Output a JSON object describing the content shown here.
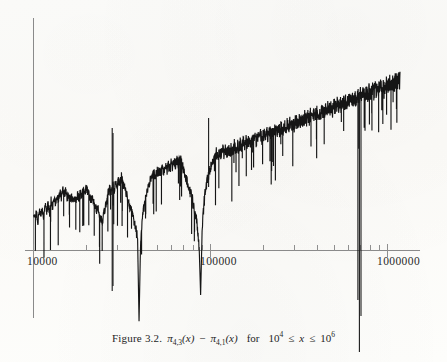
{
  "figure": {
    "label": "Figure 3.2.",
    "expression_plain": "π₄,₃(x) − π₄,₁(x)",
    "pi_symbol": "π",
    "series_a_sub": "4,3",
    "series_b_sub": "4,1",
    "var": "x",
    "minus": "−",
    "for_word": "for",
    "range_plain": "10⁴ ≤ x ≤ 10⁶",
    "range_base": "10",
    "range_exp_low": "4",
    "range_exp_high": "6",
    "le_symbol": "≤",
    "caption_full": "Figure 3.2.  π₄,₃(x) − π₄,₁(x)   for   10⁴ ≤ x ≤ 10⁶"
  },
  "axes": {
    "x_scale": "log",
    "x_min": 10000,
    "x_max": 1000000,
    "x_tick_labels": [
      "10000",
      "100000",
      "1000000"
    ],
    "x_tick_label_positions_px": [
      33,
      210,
      387
    ],
    "y_axis_visible": true,
    "y_tick_labels": [],
    "grid": false,
    "axis_color": "#8a8a8a",
    "curve_color": "#151515",
    "background_color": "#fdfdfb"
  },
  "chart_data": {
    "type": "line",
    "xlabel": "x",
    "ylabel": "π₄,₃(x) − π₄,₁(x)",
    "xscale": "log",
    "xlim": [
      10000,
      1000000
    ],
    "xticks": [
      10000,
      100000,
      1000000
    ],
    "xticklabels": [
      "10000",
      "100000",
      "1000000"
    ],
    "yticks": [],
    "grid": false,
    "legend": null,
    "series": [
      {
        "name": "pi_4,3(x) - pi_4,1(x)",
        "note": "x in log-scale pixel units 0..1 across 10^4..10^6; y in arbitrary plot units where the horizontal axis is 0 and upward is positive.",
        "x_norm": [
          0.0,
          0.004,
          0.008,
          0.012,
          0.016,
          0.02,
          0.024,
          0.028,
          0.032,
          0.036,
          0.04,
          0.044,
          0.048,
          0.052,
          0.056,
          0.06,
          0.064,
          0.068,
          0.072,
          0.076,
          0.08,
          0.084,
          0.088,
          0.092,
          0.096,
          0.1,
          0.104,
          0.108,
          0.112,
          0.116,
          0.12,
          0.124,
          0.128,
          0.132,
          0.136,
          0.14,
          0.144,
          0.148,
          0.152,
          0.156,
          0.16,
          0.164,
          0.168,
          0.172,
          0.176,
          0.18,
          0.184,
          0.188,
          0.192,
          0.196,
          0.2,
          0.204,
          0.208,
          0.212,
          0.216,
          0.22,
          0.224,
          0.228,
          0.232,
          0.236,
          0.24,
          0.244,
          0.248,
          0.252,
          0.256,
          0.26,
          0.264,
          0.268,
          0.272,
          0.276,
          0.28,
          0.284,
          0.288,
          0.292,
          0.296,
          0.3,
          0.304,
          0.308,
          0.312,
          0.316,
          0.32,
          0.324,
          0.328,
          0.332,
          0.336,
          0.34,
          0.344,
          0.348,
          0.352,
          0.356,
          0.36,
          0.364,
          0.368,
          0.372,
          0.376,
          0.38,
          0.384,
          0.388,
          0.392,
          0.396,
          0.4,
          0.404,
          0.408,
          0.412,
          0.416,
          0.42,
          0.424,
          0.428,
          0.432,
          0.436,
          0.44,
          0.444,
          0.448,
          0.452,
          0.456,
          0.46,
          0.464,
          0.468,
          0.472,
          0.476,
          0.48,
          0.484,
          0.488,
          0.492,
          0.496,
          0.5,
          0.504,
          0.508,
          0.512,
          0.516,
          0.52,
          0.524,
          0.528,
          0.532,
          0.536,
          0.54,
          0.544,
          0.548,
          0.552,
          0.556,
          0.56,
          0.564,
          0.568,
          0.572,
          0.576,
          0.58,
          0.584,
          0.588,
          0.592,
          0.596,
          0.6,
          0.604,
          0.608,
          0.612,
          0.616,
          0.62,
          0.624,
          0.628,
          0.632,
          0.636,
          0.64,
          0.644,
          0.648,
          0.652,
          0.656,
          0.66,
          0.664,
          0.668,
          0.672,
          0.676,
          0.68,
          0.684,
          0.688,
          0.692,
          0.696,
          0.7,
          0.704,
          0.708,
          0.712,
          0.716,
          0.72,
          0.724,
          0.728,
          0.732,
          0.736,
          0.74,
          0.744,
          0.748,
          0.752,
          0.756,
          0.76,
          0.764,
          0.768,
          0.772,
          0.776,
          0.78,
          0.784,
          0.788,
          0.792,
          0.796,
          0.8,
          0.804,
          0.808,
          0.812,
          0.816,
          0.82,
          0.824,
          0.828,
          0.832,
          0.836,
          0.84,
          0.844,
          0.848,
          0.852,
          0.856,
          0.86,
          0.864,
          0.868,
          0.872,
          0.876,
          0.88,
          0.884,
          0.888,
          0.892,
          0.896,
          0.9,
          0.904,
          0.908,
          0.912,
          0.916,
          0.92,
          0.924,
          0.928,
          0.932,
          0.936,
          0.94,
          0.944,
          0.948,
          0.952,
          0.956,
          0.96,
          0.964,
          0.968,
          0.972,
          0.976,
          0.98,
          0.984,
          0.988,
          0.992,
          0.996,
          1.0
        ],
        "y_units": [
          58,
          55,
          62,
          49,
          66,
          57,
          70,
          52,
          74,
          63,
          78,
          60,
          83,
          72,
          88,
          77,
          92,
          84,
          97,
          88,
          101,
          93,
          99,
          87,
          94,
          86,
          91,
          80,
          88,
          83,
          93,
          86,
          97,
          90,
          100,
          95,
          105,
          97,
          92,
          85,
          88,
          80,
          74,
          66,
          72,
          60,
          55,
          47,
          60,
          72,
          85,
          95,
          104,
          97,
          110,
          101,
          114,
          106,
          118,
          110,
          122,
          112,
          105,
          96,
          88,
          80,
          72,
          63,
          54,
          44,
          33,
          20,
          -118,
          10,
          44,
          66,
          82,
          95,
          106,
          113,
          120,
          126,
          131,
          124,
          133,
          127,
          136,
          129,
          138,
          131,
          141,
          133,
          144,
          136,
          146,
          139,
          148,
          141,
          150,
          143,
          152,
          145,
          138,
          130,
          122,
          114,
          106,
          97,
          88,
          78,
          66,
          52,
          34,
          6,
          -74,
          30,
          70,
          95,
          110,
          122,
          132,
          140,
          147,
          153,
          158,
          163,
          156,
          165,
          158,
          167,
          160,
          169,
          162,
          171,
          164,
          173,
          166,
          175,
          168,
          177,
          170,
          179,
          172,
          181,
          174,
          183,
          176,
          185,
          178,
          187,
          180,
          189,
          182,
          191,
          184,
          193,
          186,
          195,
          188,
          197,
          190,
          199,
          192,
          201,
          194,
          203,
          196,
          205,
          198,
          207,
          200,
          209,
          202,
          211,
          204,
          213,
          206,
          215,
          208,
          217,
          210,
          219,
          212,
          221,
          214,
          223,
          216,
          225,
          218,
          227,
          220,
          229,
          222,
          231,
          224,
          233,
          226,
          235,
          228,
          237,
          230,
          239,
          232,
          241,
          234,
          243,
          236,
          245,
          238,
          247,
          240,
          249,
          242,
          251,
          244,
          253,
          246,
          255,
          248,
          257,
          250,
          259,
          252,
          261,
          254,
          263,
          256,
          265,
          258,
          267,
          260,
          269,
          262,
          271,
          264,
          273,
          266,
          275,
          268,
          277,
          270,
          279,
          272,
          281,
          274,
          283,
          276,
          285,
          278,
          287,
          280,
          289,
          282,
          291,
          284,
          293,
          286,
          295,
          288,
          297,
          290,
          299,
          292,
          301,
          294,
          303,
          296,
          305,
          298
        ]
      }
    ],
    "negative_spikes": [
      {
        "x_norm": 0.288,
        "depth_units": -118,
        "note": "deep sign-change excursion near x ≈ 3×10⁴"
      },
      {
        "x_norm": 0.5,
        "depth_units": -74,
        "note": "excursion near x ≈ 1×10⁵"
      },
      {
        "x_norm": 0.905,
        "depth_units": -330,
        "note": "dominant sign-change region near x ≈ 6×10⁵, extends well below the axis"
      }
    ]
  }
}
